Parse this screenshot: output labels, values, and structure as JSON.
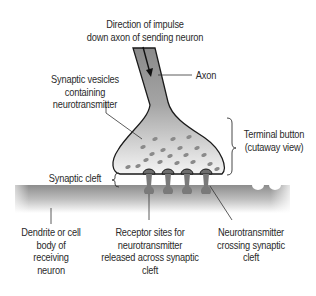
{
  "diagram": {
    "labels": {
      "direction": [
        "Direction of impulse",
        "down axon of sending neuron"
      ],
      "axon": [
        "Axon"
      ],
      "vesicles": [
        "Synaptic vesicles",
        "containing",
        "neurotransmitter"
      ],
      "terminal": [
        "Terminal button",
        "(cutaway view)"
      ],
      "cleft": [
        "Synaptic cleft"
      ],
      "dendrite": [
        "Dendrite or cell",
        "body of",
        "receiving",
        "neuron"
      ],
      "receptor": [
        "Receptor sites for",
        "neurotransmitter",
        "released across synaptic",
        "cleft"
      ],
      "crossing": [
        "Neurotransmitter",
        "crossing synaptic",
        "cleft"
      ]
    },
    "colors": {
      "axon_fill": "#8f8f8f",
      "terminal_light": "#f2f2f2",
      "vesicle": "#8a8a8a",
      "dendrite_top": "#8c8c8c",
      "outline": "#1a1a1a",
      "text": "#2a2a2a"
    }
  }
}
